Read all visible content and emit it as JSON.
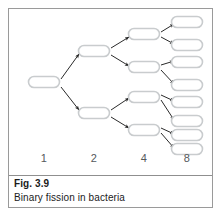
{
  "figure": {
    "caption": {
      "fig_number": "Fig. 3.9",
      "title": "Binary fission in bacteria"
    },
    "frame_color": "#9a9a9a",
    "background_color": "#ffffff"
  },
  "diagram_data": {
    "type": "tree",
    "title": "Binary fission in bacteria",
    "description": "Branching diagram showing successive binary fission of a bacterial cell through four generations",
    "cell_shape": "capsule",
    "cell_outline_color": "#c9ccce",
    "cell_fill_color": "#ffffff",
    "arrow_color": "#2a2a2a",
    "generation_label_color": "#55595c",
    "generations": [
      {
        "label": "1",
        "count": 1,
        "label_x": 35,
        "cell_x": 35,
        "cell_w": 31,
        "cell_h": 11,
        "cells_y": [
          73
        ]
      },
      {
        "label": "2",
        "count": 2,
        "label_x": 85,
        "cell_x": 85,
        "cell_w": 31,
        "cell_h": 11,
        "cells_y": [
          42,
          104
        ]
      },
      {
        "label": "4",
        "count": 4,
        "label_x": 135,
        "cell_x": 135,
        "cell_w": 31,
        "cell_h": 11,
        "cells_y": [
          25,
          58,
          88,
          121
        ]
      },
      {
        "label": "8",
        "count": 8,
        "label_x": 178,
        "cell_x": 178,
        "cell_w": 31,
        "cell_h": 11,
        "cells_y": [
          13,
          36,
          53,
          76,
          93,
          112,
          126,
          140
        ]
      }
    ],
    "arrows": [
      {
        "from": [
          52,
          70
        ],
        "to": [
          70,
          45
        ]
      },
      {
        "from": [
          52,
          78
        ],
        "to": [
          70,
          101
        ]
      },
      {
        "from": [
          102,
          39
        ],
        "to": [
          120,
          28
        ]
      },
      {
        "from": [
          102,
          46
        ],
        "to": [
          120,
          57
        ]
      },
      {
        "from": [
          102,
          101
        ],
        "to": [
          120,
          89
        ]
      },
      {
        "from": [
          102,
          108
        ],
        "to": [
          120,
          119
        ]
      },
      {
        "from": [
          152,
          23
        ],
        "to": [
          165,
          15
        ]
      },
      {
        "from": [
          152,
          28
        ],
        "to": [
          165,
          35
        ]
      },
      {
        "from": [
          152,
          56
        ],
        "to": [
          165,
          52
        ]
      },
      {
        "from": [
          152,
          61
        ],
        "to": [
          165,
          75
        ]
      },
      {
        "from": [
          152,
          86
        ],
        "to": [
          165,
          92
        ]
      },
      {
        "from": [
          152,
          91
        ],
        "to": [
          165,
          111
        ]
      },
      {
        "from": [
          152,
          119
        ],
        "to": [
          165,
          125
        ]
      },
      {
        "from": [
          152,
          124
        ],
        "to": [
          165,
          139
        ]
      }
    ]
  }
}
